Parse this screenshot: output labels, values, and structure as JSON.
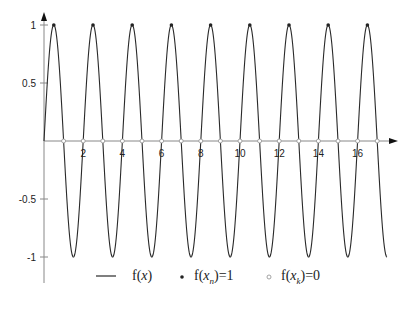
{
  "chart_data": {
    "type": "line",
    "title": "",
    "xlabel": "",
    "ylabel": "",
    "function": "f(x) = sin(pi*x)",
    "xlim": [
      0,
      17.5
    ],
    "ylim": [
      -1,
      1
    ],
    "grid": false,
    "x_ticks": [
      2,
      4,
      6,
      8,
      10,
      12,
      14,
      16
    ],
    "y_ticks": [
      -1,
      -0.5,
      0.5,
      1
    ],
    "x_tick_labels": [
      "2",
      "4",
      "6",
      "8",
      "10",
      "12",
      "14",
      "16"
    ],
    "y_tick_labels": [
      "-1",
      "-0.5",
      "0.5",
      "1"
    ],
    "series": [
      {
        "name": "f(x)",
        "kind": "line",
        "description": "sin(pi x) sampled from 0 to 17.5"
      },
      {
        "name": "f(x_n)=1",
        "kind": "filled-points",
        "x": [
          0.5,
          2.5,
          4.5,
          6.5,
          8.5,
          10.5,
          12.5,
          14.5,
          16.5
        ],
        "y": [
          1,
          1,
          1,
          1,
          1,
          1,
          1,
          1,
          1
        ]
      },
      {
        "name": "f(x_k)=0",
        "kind": "open-points",
        "x": [
          1,
          2,
          3,
          4,
          5,
          6,
          7,
          8,
          9,
          10,
          11,
          12,
          13,
          14,
          15,
          16,
          17
        ],
        "y": [
          0,
          0,
          0,
          0,
          0,
          0,
          0,
          0,
          0,
          0,
          0,
          0,
          0,
          0,
          0,
          0,
          0
        ]
      }
    ],
    "legend": {
      "position": "bottom",
      "entries": [
        {
          "marker": "line",
          "label_prefix": "f(",
          "label_var": "x",
          "label_suffix": ")"
        },
        {
          "marker": "filled-dot",
          "label_prefix": "f(",
          "label_var": "x",
          "label_sub": "n",
          "label_suffix": ")=1"
        },
        {
          "marker": "open-circle",
          "label_prefix": "f(",
          "label_var": "x",
          "label_sub": "k",
          "label_suffix": ")=0"
        }
      ]
    }
  },
  "colors": {
    "curve": "#2a2a2a",
    "axis": "#888888",
    "marker": "#222222",
    "open_marker": "#999999"
  }
}
